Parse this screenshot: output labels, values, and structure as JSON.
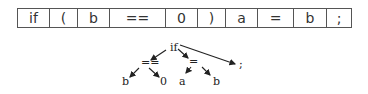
{
  "token_strip": {
    "tokens": [
      {
        "text": "if",
        "width": 32
      },
      {
        "text": "(",
        "width": 28
      },
      {
        "text": "b",
        "width": 32
      },
      {
        "text": "==",
        "width": 56
      },
      {
        "text": "0",
        "width": 32
      },
      {
        "text": ")",
        "width": 28
      },
      {
        "text": "a",
        "width": 32
      },
      {
        "text": "=",
        "width": 36
      },
      {
        "text": "b",
        "width": 33
      },
      {
        "text": ";",
        "width": 24
      }
    ]
  },
  "syntax_tree": {
    "root": {
      "label": "if",
      "x": 170,
      "y": 51
    },
    "nodes": [
      {
        "id": "eq_cmp",
        "label": "==",
        "x": 141,
        "y": 66,
        "parent": "root"
      },
      {
        "id": "assign",
        "label": "=",
        "x": 189,
        "y": 65,
        "parent": "root"
      },
      {
        "id": "semi",
        "label": ";",
        "x": 239,
        "y": 68,
        "parent": "root"
      },
      {
        "id": "b1",
        "label": "b",
        "x": 122,
        "y": 85,
        "parent": "eq_cmp"
      },
      {
        "id": "zero",
        "label": "0",
        "x": 160,
        "y": 85,
        "parent": "eq_cmp"
      },
      {
        "id": "a",
        "label": "a",
        "x": 179,
        "y": 85,
        "parent": "assign"
      },
      {
        "id": "b2",
        "label": "b",
        "x": 213,
        "y": 85,
        "parent": "assign"
      }
    ]
  }
}
